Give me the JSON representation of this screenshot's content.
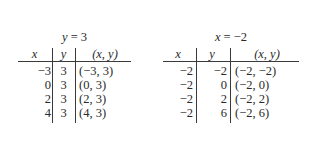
{
  "tables": [
    {
      "title": {
        "var": "y",
        "eq": " = ",
        "val": "3"
      },
      "headers": {
        "x": "x",
        "y": "y",
        "xy": "(x, y)"
      },
      "rows": [
        {
          "x": "−3",
          "y": "3",
          "xy": "(−3, 3)"
        },
        {
          "x": "0",
          "y": "3",
          "xy": "(0, 3)"
        },
        {
          "x": "2",
          "y": "3",
          "xy": "(2, 3)"
        },
        {
          "x": "4",
          "y": "3",
          "xy": "(4, 3)"
        }
      ]
    },
    {
      "title": {
        "var": "x",
        "eq": " = ",
        "val": "−2"
      },
      "headers": {
        "x": "x",
        "y": "y",
        "xy": "(x, y)"
      },
      "rows": [
        {
          "x": "−2",
          "y": "−2",
          "xy": "(−2, −2)"
        },
        {
          "x": "−2",
          "y": "0",
          "xy": "(−2, 0)"
        },
        {
          "x": "−2",
          "y": "2",
          "xy": "(−2, 2)"
        },
        {
          "x": "−2",
          "y": "6",
          "xy": "(−2, 6)"
        }
      ]
    }
  ]
}
